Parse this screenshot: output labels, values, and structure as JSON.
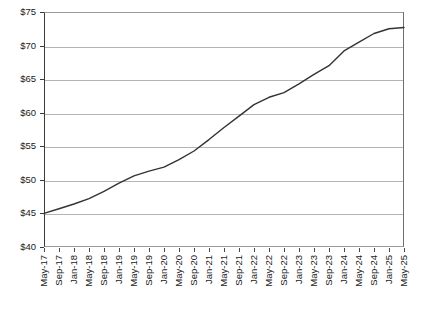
{
  "chart_data": {
    "type": "line",
    "title": "",
    "subtitle": "",
    "xlabel": "",
    "ylabel": "",
    "ylim": [
      40,
      75
    ],
    "ytick_values": [
      40,
      45,
      50,
      55,
      60,
      65,
      70,
      75
    ],
    "ytick_labels": [
      "$40",
      "$45",
      "$50",
      "$55",
      "$60",
      "$65",
      "$70",
      "$75"
    ],
    "ytick_prefix": "$",
    "ytick_step": 5,
    "grid": true,
    "grid_axis": "y",
    "legend": false,
    "legend_position": "none",
    "line_color": "#333333",
    "line_width": 1.4,
    "markers": false,
    "xtick_labels": [
      "May-17",
      "Sep-17",
      "Jan-18",
      "May-18",
      "Sep-18",
      "Jan-19",
      "May-19",
      "Sep-19",
      "Jan-20",
      "May-20",
      "Sep-20",
      "Jan-21",
      "May-21",
      "Sep-21",
      "Jan-22",
      "May-22",
      "Sep-22",
      "Jan-23",
      "May-23",
      "Sep-23",
      "Jan-24",
      "May-24",
      "Sep-24",
      "Jan-25",
      "May-25"
    ],
    "xtick_rotation": 90,
    "x": [
      "May-17",
      "Sep-17",
      "Jan-18",
      "May-18",
      "Sep-18",
      "Jan-19",
      "May-19",
      "Sep-19",
      "Jan-20",
      "May-20",
      "Sep-20",
      "Jan-21",
      "May-21",
      "Sep-21",
      "Jan-22",
      "May-22",
      "Sep-22",
      "Jan-23",
      "May-23",
      "Sep-23",
      "Jan-24",
      "May-24",
      "Sep-24",
      "Jan-25",
      "May-25"
    ],
    "values": [
      45.0,
      45.7,
      46.4,
      47.2,
      48.3,
      49.5,
      50.6,
      51.3,
      51.9,
      53.0,
      54.3,
      56.0,
      57.8,
      59.5,
      61.2,
      62.3,
      63.0,
      64.3,
      65.7,
      67.0,
      69.2,
      70.5,
      71.8,
      72.5,
      72.7
    ],
    "series": [
      {
        "name": "",
        "values": [
          45.0,
          45.7,
          46.4,
          47.2,
          48.3,
          49.5,
          50.6,
          51.3,
          51.9,
          53.0,
          54.3,
          56.0,
          57.8,
          59.5,
          61.2,
          62.3,
          63.0,
          64.3,
          65.7,
          67.0,
          69.2,
          70.5,
          71.8,
          72.5,
          72.7
        ]
      }
    ]
  }
}
